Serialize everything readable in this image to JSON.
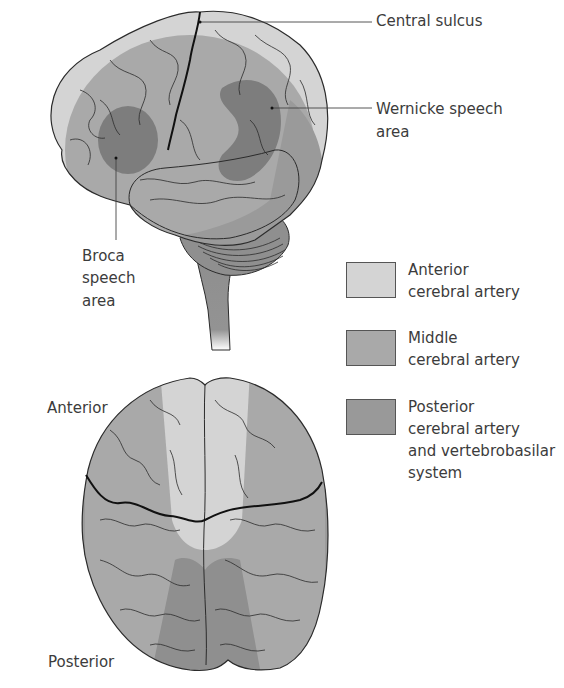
{
  "figure": {
    "lateral_view": {
      "labels": {
        "central_sulcus": "Central sulcus",
        "wernicke_line1": "Wernicke speech",
        "wernicke_line2": "area",
        "broca_line1": "Broca",
        "broca_line2": "speech",
        "broca_line3": "area"
      }
    },
    "superior_view": {
      "labels": {
        "anterior": "Anterior",
        "posterior": "Posterior"
      }
    },
    "legend": [
      {
        "line1": "Anterior",
        "line2": "cerebral artery",
        "line3": "",
        "line4": "",
        "color": "#d4d4d4"
      },
      {
        "line1": "Middle",
        "line2": "cerebral artery",
        "line3": "",
        "line4": "",
        "color": "#a9a9a9"
      },
      {
        "line1": "Posterior",
        "line2": "cerebral artery",
        "line3": "and vertebrobasilar",
        "line4": "system",
        "color": "#999999"
      }
    ],
    "colors": {
      "anterior": "#d4d4d4",
      "middle": "#a9a9a9",
      "posterior": "#8f8f8f",
      "speech_area": "#7d7d7d",
      "outline": "#2b2b2b"
    }
  }
}
